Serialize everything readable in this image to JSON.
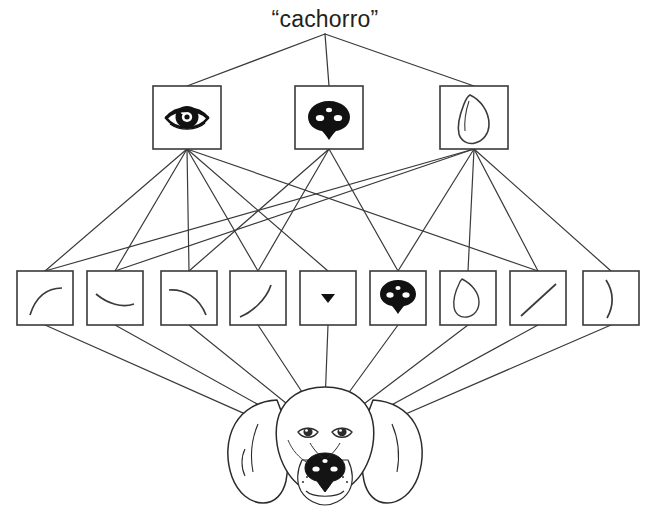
{
  "diagram": {
    "title_word": "“cachorro”",
    "stroke_color": "#3a3a3c",
    "fill_color": "#ffffff",
    "text_color": "#231f20",
    "background": "#ffffff"
  },
  "layers": {
    "word_layer": {
      "name": "word-layer",
      "label": "“cachorro”",
      "x": 325,
      "y": 20
    },
    "part_layer": {
      "name": "part-detector-layer",
      "boxes": [
        {
          "id": "part-eye",
          "icon": "dog-eye-icon",
          "label": "eye",
          "x": 153,
          "y": 86,
          "w": 68,
          "h": 63
        },
        {
          "id": "part-nose",
          "icon": "dog-nose-icon",
          "label": "nose",
          "x": 295,
          "y": 86,
          "w": 68,
          "h": 63
        },
        {
          "id": "part-ear",
          "icon": "dog-ear-icon",
          "label": "ear",
          "x": 440,
          "y": 86,
          "w": 68,
          "h": 63
        }
      ]
    },
    "feature_layer": {
      "name": "feature-detector-layer",
      "boxes": [
        {
          "id": "feat-1",
          "icon": "curve-up-right-icon",
          "label": "curve opening down-left",
          "x": 17,
          "y": 271,
          "w": 56,
          "h": 54
        },
        {
          "id": "feat-2",
          "icon": "shallow-dip-icon",
          "label": "shallow dip curve",
          "x": 87,
          "y": 271,
          "w": 56,
          "h": 54
        },
        {
          "id": "feat-3",
          "icon": "curve-down-right-icon",
          "label": "curve bending down-right",
          "x": 161,
          "y": 271,
          "w": 56,
          "h": 54
        },
        {
          "id": "feat-4",
          "icon": "curve-up-steep-icon",
          "label": "steep rising curve",
          "x": 230,
          "y": 271,
          "w": 56,
          "h": 54
        },
        {
          "id": "feat-5",
          "icon": "triangle-down-icon",
          "label": "small dark triangle",
          "x": 300,
          "y": 271,
          "w": 56,
          "h": 54
        },
        {
          "id": "feat-6",
          "icon": "dog-nose-small-icon",
          "label": "nose blob",
          "x": 370,
          "y": 271,
          "w": 56,
          "h": 54
        },
        {
          "id": "feat-7",
          "icon": "ear-outline-icon",
          "label": "ear outline",
          "x": 440,
          "y": 271,
          "w": 56,
          "h": 54
        },
        {
          "id": "feat-8",
          "icon": "diagonal-line-icon",
          "label": "diagonal line",
          "x": 510,
          "y": 271,
          "w": 56,
          "h": 54
        },
        {
          "id": "feat-9",
          "icon": "vertical-arc-icon",
          "label": "vertical arc",
          "x": 583,
          "y": 271,
          "w": 56,
          "h": 54
        }
      ]
    },
    "image_layer": {
      "name": "dog-head-image-layer",
      "label": "dog head photograph",
      "x": 325,
      "y": 455
    }
  },
  "connections": {
    "word_to_parts": [
      {
        "from": "word-layer",
        "to": "part-eye"
      },
      {
        "from": "word-layer",
        "to": "part-nose"
      },
      {
        "from": "word-layer",
        "to": "part-ear"
      }
    ],
    "parts_to_features": [
      {
        "from": "part-eye",
        "to": "feat-1"
      },
      {
        "from": "part-eye",
        "to": "feat-2"
      },
      {
        "from": "part-eye",
        "to": "feat-3"
      },
      {
        "from": "part-eye",
        "to": "feat-4"
      },
      {
        "from": "part-eye",
        "to": "feat-5"
      },
      {
        "from": "part-eye",
        "to": "feat-8"
      },
      {
        "from": "part-nose",
        "to": "feat-3"
      },
      {
        "from": "part-nose",
        "to": "feat-4"
      },
      {
        "from": "part-nose",
        "to": "feat-6"
      },
      {
        "from": "part-ear",
        "to": "feat-1"
      },
      {
        "from": "part-ear",
        "to": "feat-2"
      },
      {
        "from": "part-ear",
        "to": "feat-6"
      },
      {
        "from": "part-ear",
        "to": "feat-7"
      },
      {
        "from": "part-ear",
        "to": "feat-8"
      },
      {
        "from": "part-ear",
        "to": "feat-9"
      }
    ],
    "features_to_image": [
      {
        "from": "feat-1",
        "to": "dog-head-image-layer"
      },
      {
        "from": "feat-2",
        "to": "dog-head-image-layer"
      },
      {
        "from": "feat-3",
        "to": "dog-head-image-layer"
      },
      {
        "from": "feat-4",
        "to": "dog-head-image-layer"
      },
      {
        "from": "feat-5",
        "to": "dog-head-image-layer"
      },
      {
        "from": "feat-6",
        "to": "dog-head-image-layer"
      },
      {
        "from": "feat-7",
        "to": "dog-head-image-layer"
      },
      {
        "from": "feat-8",
        "to": "dog-head-image-layer"
      },
      {
        "from": "feat-9",
        "to": "dog-head-image-layer"
      }
    ]
  }
}
